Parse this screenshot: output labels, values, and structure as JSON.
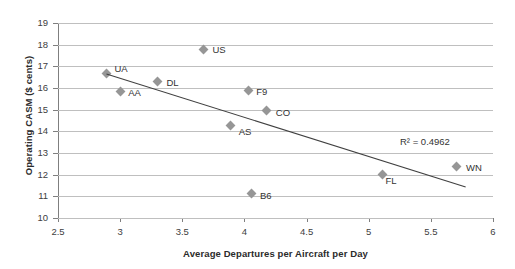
{
  "chart_data": {
    "type": "scatter",
    "title": "",
    "xlabel": "Average Departures per Aircraft per Day",
    "ylabel": "Operating CASM ($ cents)",
    "xlim": [
      2.5,
      6
    ],
    "ylim": [
      10,
      19
    ],
    "xticks": [
      2.5,
      3,
      3.5,
      4,
      4.5,
      5,
      5.5,
      6
    ],
    "xtick_labels": [
      "2.5",
      "3",
      "3.5",
      "4",
      "4.5",
      "5",
      "5.5",
      "6"
    ],
    "yticks": [
      10,
      11,
      12,
      13,
      14,
      15,
      16,
      17,
      18,
      19
    ],
    "ytick_labels": [
      "10",
      "11",
      "12",
      "13",
      "14",
      "15",
      "16",
      "17",
      "18",
      "19"
    ],
    "grid": "horizontal",
    "legend": "none",
    "marker_color": "#969696",
    "gridline_color": "#bfbfbf",
    "trendline_color": "#404040",
    "points": [
      {
        "label": "UA",
        "x": 2.89,
        "y": 16.65,
        "label_dx": 8,
        "label_dy": -10
      },
      {
        "label": "AA",
        "x": 3.0,
        "y": 15.82,
        "label_dx": 8,
        "label_dy": -4
      },
      {
        "label": "DL",
        "x": 3.3,
        "y": 16.28,
        "label_dx": 9,
        "label_dy": -4
      },
      {
        "label": "US",
        "x": 3.67,
        "y": 17.8,
        "label_dx": 9,
        "label_dy": -4
      },
      {
        "label": "F9",
        "x": 4.03,
        "y": 15.9,
        "label_dx": 8,
        "label_dy": -3
      },
      {
        "label": "AS",
        "x": 3.89,
        "y": 14.25,
        "label_dx": 8,
        "label_dy": 1
      },
      {
        "label": "CO",
        "x": 4.18,
        "y": 14.94,
        "label_dx": 9,
        "label_dy": -3
      },
      {
        "label": "B6",
        "x": 4.06,
        "y": 11.15,
        "label_dx": 8,
        "label_dy": -2
      },
      {
        "label": "FL",
        "x": 5.11,
        "y": 12.0,
        "label_dx": 3,
        "label_dy": 1
      },
      {
        "label": "WN",
        "x": 5.71,
        "y": 12.4,
        "label_dx": 9,
        "label_dy": -3
      }
    ],
    "trendline": {
      "x1": 2.89,
      "y1": 16.65,
      "x2": 5.78,
      "y2": 11.43
    },
    "annotations": [
      {
        "name": "r-squared",
        "text": "R² = 0.4962"
      }
    ]
  }
}
